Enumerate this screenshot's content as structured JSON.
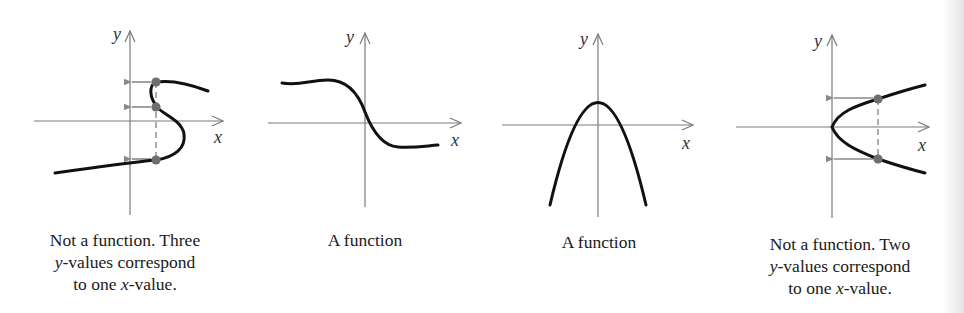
{
  "figure": {
    "panels": [
      {
        "id": "s-curve",
        "axis_labels": {
          "x": "x",
          "y": "y"
        },
        "caption_lines": [
          {
            "pre": "Not a function. Three",
            "var": "",
            "post": ""
          },
          {
            "pre": "",
            "var": "y",
            "post": "-values correspond"
          },
          {
            "pre": "to one ",
            "var": "x",
            "post": "-value."
          }
        ],
        "is_function": false,
        "highlighted_points": 3
      },
      {
        "id": "decreasing-curve",
        "axis_labels": {
          "x": "x",
          "y": "y"
        },
        "caption_lines": [
          {
            "pre": "A function",
            "var": "",
            "post": ""
          }
        ],
        "is_function": true,
        "highlighted_points": 0
      },
      {
        "id": "downward-parabola",
        "axis_labels": {
          "x": "x",
          "y": "y"
        },
        "caption_lines": [
          {
            "pre": "A function",
            "var": "",
            "post": ""
          }
        ],
        "is_function": true,
        "highlighted_points": 0
      },
      {
        "id": "sideways-parabola",
        "axis_labels": {
          "x": "x",
          "y": "y"
        },
        "caption_lines": [
          {
            "pre": "Not a function. Two",
            "var": "",
            "post": ""
          },
          {
            "pre": "",
            "var": "y",
            "post": "-values correspond"
          },
          {
            "pre": "to one ",
            "var": "x",
            "post": "-value."
          }
        ],
        "is_function": false,
        "highlighted_points": 2
      }
    ],
    "colors": {
      "curve": "#111111",
      "axis": "#7a7a7a",
      "marker": "#6e6e6e",
      "arrow": "#8a8a8a",
      "text": "#1a1a1a"
    }
  }
}
